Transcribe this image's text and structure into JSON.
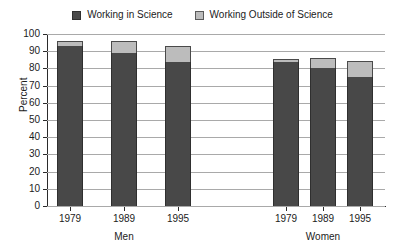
{
  "chart_data": {
    "type": "bar",
    "subtype": "stacked-bar",
    "title": "",
    "xlabel": "",
    "ylabel": "Percent",
    "ylim": [
      0,
      100
    ],
    "ytick_step": 10,
    "yticks": [
      0,
      10,
      20,
      30,
      40,
      50,
      60,
      70,
      80,
      90,
      100
    ],
    "grid": true,
    "legend_position": "top-center",
    "categories": [
      "1979",
      "1989",
      "1995",
      "1979",
      "1989",
      "1995"
    ],
    "groups": [
      {
        "label": "Men",
        "categories": [
          "1979",
          "1989",
          "1995"
        ]
      },
      {
        "label": "Women",
        "categories": [
          "1979",
          "1989",
          "1995"
        ]
      }
    ],
    "series": [
      {
        "name": "Working in Science",
        "color": "#484848",
        "values": [
          93,
          89,
          84,
          83.5,
          80,
          75
        ]
      },
      {
        "name": "Working Outside of Science",
        "color": "#bcbcbc",
        "values": [
          3,
          7,
          9,
          2,
          6,
          9.5
        ]
      }
    ],
    "totals": [
      96,
      96,
      93,
      85.5,
      86,
      84.5
    ]
  },
  "legend": {
    "entries": [
      {
        "label": "Working in Science",
        "swatch": "dark"
      },
      {
        "label": "Working Outside of Science",
        "swatch": "light"
      }
    ]
  },
  "axes": {
    "y_label": "Percent",
    "y_ticks": [
      "100",
      "90",
      "80",
      "70",
      "60",
      "50",
      "40",
      "30",
      "20",
      "10",
      "0"
    ],
    "x_ticks": [
      "1979",
      "1989",
      "1995",
      "1979",
      "1989",
      "1995"
    ],
    "group_labels": [
      "Men",
      "Women"
    ]
  },
  "colors": {
    "series_in_science": "#484848",
    "series_outside_science": "#bcbcbc",
    "gridline": "#a9a9a9",
    "axis": "#2b2b2b",
    "background": "#ffffff"
  }
}
